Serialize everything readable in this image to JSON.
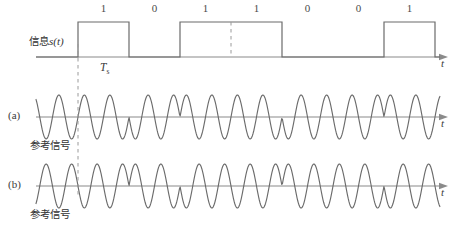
{
  "figure": {
    "caption": "",
    "axis_label": "t",
    "symbol_period_label": "T",
    "symbol_period_sub": "s"
  },
  "message_row": {
    "signal_label_cjk": "信息",
    "signal_label_math": "s(t)",
    "bits": [
      "1",
      "0",
      "1",
      "1",
      "0",
      "0",
      "1"
    ],
    "axis_label": "t"
  },
  "rows": [
    {
      "id": "a",
      "row_label": "(a)",
      "caption": "参考信号",
      "axis_label": "t"
    },
    {
      "id": "b",
      "row_label": "(b)",
      "caption": "参考信号",
      "axis_label": "t"
    }
  ],
  "colors": {
    "line": "#6b6b6b",
    "axis": "#8a8a8a",
    "dashed": "#9a9a9a",
    "text": "#3a3a3a"
  },
  "chart_data": {
    "type": "line",
    "title": "",
    "xlabel": "t",
    "ylabel": "",
    "grid": false,
    "legend": "none",
    "bit_sequence": [
      1,
      0,
      1,
      1,
      0,
      0,
      1
    ],
    "symbol_period_px": 51,
    "first_symbol_start_px": 78,
    "series": [
      {
        "name": "信息s(t)",
        "kind": "rectangular-pulse-train",
        "levels": [
          1,
          0,
          1,
          1,
          0,
          0,
          1
        ],
        "baseline_y_px": 57,
        "high_y_px": 22
      },
      {
        "name": "(a) 参考信号",
        "kind": "phase-shift-keyed-carrier",
        "baseline_y_px": 117,
        "amplitude_px": 22,
        "cycles_per_symbol": 2,
        "phase_per_symbol_deg": [
          0,
          180,
          0,
          0,
          180,
          180,
          0
        ]
      },
      {
        "name": "(b) 参考信号",
        "kind": "phase-shift-keyed-carrier",
        "baseline_y_px": 186,
        "amplitude_px": 22,
        "cycles_per_symbol": 2,
        "phase_per_symbol_deg": [
          180,
          0,
          180,
          180,
          0,
          0,
          180
        ]
      }
    ]
  }
}
